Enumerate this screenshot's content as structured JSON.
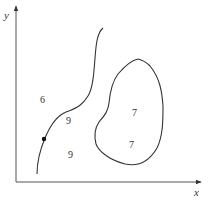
{
  "diagram": {
    "axes": {
      "x_label": "x",
      "y_label": "y"
    },
    "region_labels": {
      "left_upper": "6",
      "curve_right_upper": "9",
      "curve_right_lower": "9",
      "blob_upper": "7",
      "blob_lower": "7"
    },
    "elements": {
      "open_curve": "curve from bottom-left rising to top",
      "closed_curve": "closed blob region",
      "marked_point": "dot on open curve"
    },
    "colors": {
      "stroke": "#333333",
      "background": "#ffffff"
    }
  }
}
